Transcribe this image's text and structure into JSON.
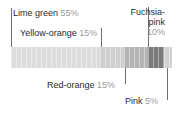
{
  "chart_data": {
    "type": "bar",
    "orientation": "horizontal-stacked",
    "title": "",
    "xlabel": "",
    "ylabel": "",
    "grid": false,
    "legend_position": "callout-labels",
    "categories": [
      "Lime green",
      "Yellow-orange",
      "Red-orange",
      "Fuchsia-pink",
      "Pink"
    ],
    "values": [
      55,
      15,
      15,
      10,
      5
    ],
    "unit": "%",
    "total": 100,
    "series": [
      {
        "name": "Share",
        "values": [
          55,
          15,
          15,
          10,
          5
        ]
      }
    ],
    "segments": [
      {
        "name": "Lime green",
        "value": 55,
        "value_label": "55%",
        "fill": "#dcdcdc"
      },
      {
        "name": "Yellow-orange",
        "value": 15,
        "value_label": "15%",
        "fill": "#cfcfcf"
      },
      {
        "name": "Red-orange",
        "value": 15,
        "value_label": "15%",
        "fill": "#b4b4b4"
      },
      {
        "name": "Fuchsia-pink",
        "value": 10,
        "value_label": "10%",
        "fill": "#7a7a7a"
      },
      {
        "name": "Pink",
        "value": 5,
        "value_label": "5%",
        "fill": "#d2d2d2"
      }
    ],
    "annotations": [
      {
        "label": "Lime green",
        "value_label": "55%",
        "position": "top-left"
      },
      {
        "label": "Yellow-orange",
        "value_label": "15%",
        "position": "top-left-lower"
      },
      {
        "label": "Fuchsia-\npink",
        "value_label": "10%",
        "position": "top-right"
      },
      {
        "label": "Red-orange",
        "value_label": "15%",
        "position": "bottom-left"
      },
      {
        "label": "Pink",
        "value_label": "5%",
        "position": "bottom-right"
      }
    ]
  },
  "labels": {
    "lime_green": {
      "name": "Lime green",
      "pct": "55%"
    },
    "yellow_orange": {
      "name": "Yellow-orange",
      "pct": "15%"
    },
    "fuchsia_pink": {
      "name_line1": "Fuchsia-",
      "name_line2": "pink",
      "pct": "10%"
    },
    "red_orange": {
      "name": "Red-orange",
      "pct": "15%"
    },
    "pink": {
      "name": "Pink",
      "pct": "5%"
    }
  },
  "colors": {
    "text": "#2b2b2b",
    "percent_text": "#9a9a9a",
    "leader_line": "#6e6e6e",
    "background": "#ffffff"
  }
}
